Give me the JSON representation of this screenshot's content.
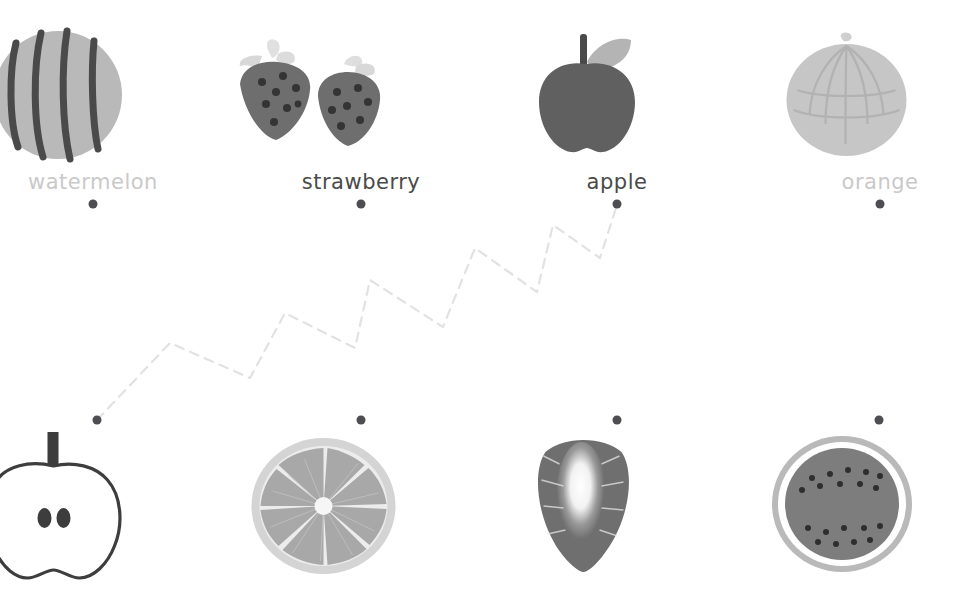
{
  "exercise": {
    "type": "matching-activity",
    "title": "fruit matching",
    "columns": 4,
    "rows": 2
  },
  "palette": {
    "ink_dark": "#4a4a4a",
    "ink_dim": "#c9c9c9",
    "dot": "#4e4e52",
    "connector_line": "#e2e2e2",
    "watermelon_flesh": "#b9b9b9",
    "watermelon_stripe": "#4a4a4a",
    "strawberry_body": "#6e6e6e",
    "strawberry_leaf": "#d8d8d8",
    "strawberry_seed": "#3a3a3a",
    "apple_body": "#606060",
    "apple_leaf": "#b4b4b4",
    "apple_stem": "#4a4a4a",
    "orange_body": "#c6c6c6",
    "orange_texture": "#b3b3b3",
    "outline_apple": "#3d3d3d",
    "orange_slice_rind": "#d4d4d4",
    "orange_slice_flesh": "#a8a8a8",
    "strawberry_cut_dark": "#6f6f6f",
    "strawberry_cut_core": "#fdfdfd",
    "watermelon_slice_rind": "#b9b9b9",
    "watermelon_slice_flesh": "#7d7d7d",
    "watermelon_slice_seed": "#2e2e2e"
  },
  "top_row": [
    {
      "id": "watermelon",
      "label": "watermelon",
      "label_tone": "dim",
      "icon": "watermelon-whole-icon",
      "center_x": 93,
      "label_y": 170,
      "dot": {
        "x": 93,
        "y": 204,
        "name": "connector-dot-watermelon"
      }
    },
    {
      "id": "strawberry",
      "label": "strawberry",
      "label_tone": "dark",
      "icon": "strawberry-pair-icon",
      "center_x": 361,
      "label_y": 170,
      "dot": {
        "x": 361,
        "y": 204,
        "name": "connector-dot-strawberry"
      }
    },
    {
      "id": "apple",
      "label": "apple",
      "label_tone": "dark",
      "icon": "apple-whole-icon",
      "center_x": 617,
      "label_y": 170,
      "dot": {
        "x": 617,
        "y": 204,
        "name": "connector-dot-apple"
      }
    },
    {
      "id": "orange",
      "label": "orange",
      "label_tone": "dim",
      "icon": "orange-whole-icon",
      "center_x": 880,
      "label_y": 170,
      "dot": {
        "x": 880,
        "y": 204,
        "name": "connector-dot-orange"
      }
    }
  ],
  "bottom_row": [
    {
      "id": "apple-cross-section",
      "icon": "apple-cross-section-icon",
      "center_x": 97,
      "dot": {
        "x": 97,
        "y": 420,
        "name": "connector-dot-apple-cross-section"
      }
    },
    {
      "id": "orange-slice",
      "icon": "orange-slice-icon",
      "center_x": 361,
      "dot": {
        "x": 361,
        "y": 420,
        "name": "connector-dot-orange-slice"
      }
    },
    {
      "id": "strawberry-cross-section",
      "icon": "strawberry-cross-section-icon",
      "center_x": 617,
      "dot": {
        "x": 617,
        "y": 420,
        "name": "connector-dot-strawberry-cross-section"
      }
    },
    {
      "id": "watermelon-slice",
      "icon": "watermelon-slice-icon",
      "center_x": 879,
      "dot": {
        "x": 879,
        "y": 420,
        "name": "connector-dot-watermelon-slice"
      }
    }
  ],
  "connections": [
    {
      "name": "connection-apple",
      "from": "connector-dot-apple-cross-section",
      "to": "connector-dot-apple",
      "style": "dashed-zigzag",
      "points": "97,420 170,343 250,378 285,313 355,348 370,280 443,327 475,248 537,292 553,225 600,258 617,205"
    }
  ]
}
